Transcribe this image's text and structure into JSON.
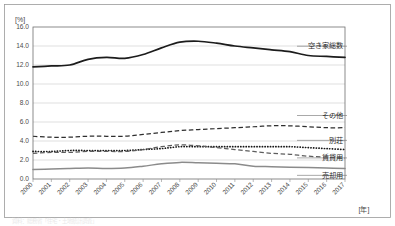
{
  "chart_data": {
    "type": "line",
    "title": "",
    "xlabel": "[年]",
    "ylabel": "[%]",
    "ylim": [
      0.0,
      16.0
    ],
    "ytick_step": 2.0,
    "grid": true,
    "legend_position": "right-inline",
    "categories": [
      "2000",
      "2001",
      "2002",
      "2003",
      "2004",
      "2005",
      "2006",
      "2007",
      "2008",
      "2009",
      "2010",
      "2011",
      "2012",
      "2013",
      "2014",
      "2015",
      "2016",
      "2017"
    ],
    "ytick_labels": [
      "0.0",
      "2.0",
      "4.0",
      "6.0",
      "8.0",
      "10.0",
      "12.0",
      "14.0",
      "16.0"
    ],
    "series": [
      {
        "name": "空き家総数",
        "style": "solid-black",
        "color": "#1c1c1c",
        "values": [
          11.8,
          11.9,
          12.0,
          12.6,
          12.8,
          12.7,
          13.1,
          13.8,
          14.4,
          14.5,
          14.3,
          14.0,
          13.8,
          13.6,
          13.4,
          13.0,
          12.9,
          12.8
        ]
      },
      {
        "name": "その他",
        "style": "dashed-dark",
        "color": "#2e2e2e",
        "values": [
          4.5,
          4.4,
          4.4,
          4.5,
          4.5,
          4.5,
          4.7,
          4.9,
          5.1,
          5.2,
          5.3,
          5.4,
          5.5,
          5.6,
          5.6,
          5.5,
          5.4,
          5.4
        ]
      },
      {
        "name": "別荘",
        "style": "dotted-black",
        "color": "#171717",
        "values": [
          2.9,
          2.9,
          3.0,
          3.0,
          3.0,
          3.0,
          3.1,
          3.2,
          3.4,
          3.4,
          3.4,
          3.4,
          3.4,
          3.4,
          3.4,
          3.3,
          3.2,
          3.1
        ]
      },
      {
        "name": "賃貸用",
        "style": "dashed-gray",
        "color": "#5d5d5d",
        "values": [
          2.7,
          2.8,
          2.8,
          2.9,
          2.9,
          2.9,
          3.1,
          3.4,
          3.6,
          3.5,
          3.3,
          3.1,
          2.9,
          2.7,
          2.6,
          2.4,
          2.3,
          2.2
        ]
      },
      {
        "name": "売却用",
        "style": "solid-gray",
        "color": "#8b8b8b",
        "values": [
          1.0,
          1.05,
          1.1,
          1.15,
          1.1,
          1.15,
          1.35,
          1.6,
          1.75,
          1.7,
          1.65,
          1.6,
          1.35,
          1.3,
          1.25,
          1.2,
          1.15,
          1.1
        ]
      }
    ]
  },
  "axes": {
    "y_unit": "[%]",
    "x_unit": "[年]"
  },
  "footnote": "資料：総務省「住宅・土地統計調査」"
}
